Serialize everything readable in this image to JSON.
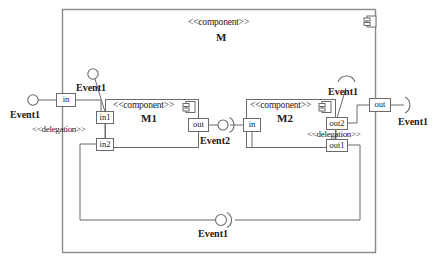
{
  "diagram": {
    "type": "uml-component-diagram",
    "stroke_color": "#5a5a5a",
    "text_color": "#1a1a1a",
    "background": "#ffffff"
  },
  "outer_component": {
    "stereotype": "<<component>>",
    "name": "M",
    "icon": "component-icon"
  },
  "components": [
    {
      "id": "m1",
      "stereotype": "<<component>>",
      "name": "M1",
      "icon": "component-icon",
      "ports": [
        {
          "id": "in1",
          "label": "in1"
        },
        {
          "id": "in2",
          "label": "in2"
        },
        {
          "id": "out",
          "label": "out"
        }
      ]
    },
    {
      "id": "m2",
      "stereotype": "<<component>>",
      "name": "M2",
      "icon": "component-icon",
      "ports": [
        {
          "id": "in",
          "label": "in"
        },
        {
          "id": "out2",
          "label": "out2"
        },
        {
          "id": "out1",
          "label": "out1"
        }
      ]
    }
  ],
  "outer_ports": [
    {
      "id": "in",
      "label": "in"
    },
    {
      "id": "out",
      "label": "out"
    }
  ],
  "interfaces": [
    {
      "id": "iface-left",
      "name": "Event1",
      "shape": "provided-ball"
    },
    {
      "id": "iface-above-m1",
      "name": "Event1",
      "shape": "provided-ball"
    },
    {
      "id": "iface-middle",
      "name": "Event2",
      "shape": "assembly-ball-socket"
    },
    {
      "id": "iface-above-m2",
      "name": "Event1",
      "shape": "required-socket"
    },
    {
      "id": "iface-right",
      "name": "Event1",
      "shape": "required-socket"
    },
    {
      "id": "iface-bottom",
      "name": "Event1",
      "shape": "assembly-ball-socket"
    }
  ],
  "connectors": [
    {
      "id": "deleg-left",
      "stereotype": "<<delegation>>"
    },
    {
      "id": "deleg-right",
      "stereotype": "<<delegation>>"
    }
  ],
  "labels": {
    "event1": "Event1",
    "event2": "Event2",
    "delegation": "<<delegation>>",
    "component_stereotype": "<<component>>"
  }
}
